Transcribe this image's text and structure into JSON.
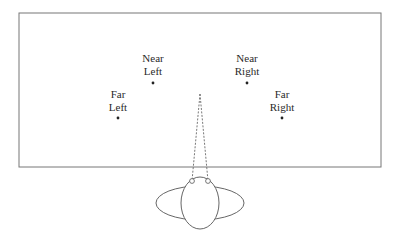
{
  "diagram": {
    "targets": [
      {
        "id": "near-left",
        "line1": "Near",
        "line2": "Left"
      },
      {
        "id": "near-right",
        "line1": "Near",
        "line2": "Right"
      },
      {
        "id": "far-left",
        "line1": "Far",
        "line2": "Left"
      },
      {
        "id": "far-right",
        "line1": "Far",
        "line2": "Right"
      }
    ],
    "colors": {
      "stroke": "#555555",
      "text": "#2a2a2a",
      "background": "#ffffff"
    }
  }
}
